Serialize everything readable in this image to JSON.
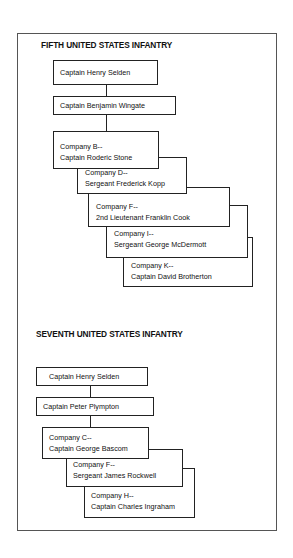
{
  "fifth": {
    "title": "FIFTH UNITED STATES INFANTRY",
    "commanders": [
      "Captain Henry Selden",
      "Captain Benjamin Wingate"
    ],
    "companies": [
      {
        "company": "Company B--",
        "leader": "Captain Roderic Stone"
      },
      {
        "company": "Company D--",
        "leader": "Sergeant Frederick Kopp"
      },
      {
        "company": "Company F--",
        "leader": "2nd Lieutenant Franklin Cook"
      },
      {
        "company": "Company I--",
        "leader": "Sergeant George McDermott"
      },
      {
        "company": "Company K--",
        "leader": "Captain David Brotherton"
      }
    ]
  },
  "seventh": {
    "title": "SEVENTH UNITED STATES INFANTRY",
    "commanders": [
      "Captain Henry Selden",
      "Captain Peter Plympton"
    ],
    "companies": [
      {
        "company": "Company C--",
        "leader": "Captain George Bascom"
      },
      {
        "company": "Company F--",
        "leader": "Sergeant James Rockwell"
      },
      {
        "company": "Company H--",
        "leader": "Captain Charles Ingraham"
      }
    ]
  }
}
